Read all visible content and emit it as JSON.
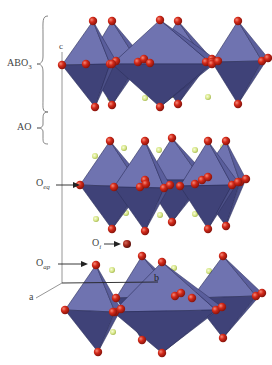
{
  "figure": {
    "labels": {
      "abo3": {
        "main": "ABO",
        "sub": "3"
      },
      "ao": {
        "main": "AO"
      },
      "o_eq": {
        "main": "O",
        "sub": "eq"
      },
      "o_ap": {
        "main": "O",
        "sub": "ap"
      },
      "o_i": {
        "main": "O",
        "sub": "i"
      },
      "axis_a": "a",
      "axis_b": "b",
      "axis_c": "c"
    },
    "colors": {
      "octahedron_light": "#6f73b0",
      "octahedron_mid": "#5a5e9c",
      "octahedron_dark": "#3f4278",
      "octahedron_edge": "#2c2f5a",
      "oxygen": "#d42a1a",
      "oxygen_highlight": "#f26a55",
      "interstitial_oxygen": "#a8281c",
      "a_cation": "#d8e88a",
      "axis_line": "#8a8a8a",
      "label_text": "#444444"
    },
    "layers": [
      {
        "name": "top-octahedra-layer",
        "top": 21,
        "eq": 65,
        "bottom": 107,
        "back": [
          [
            112,
            21,
            86,
            64,
            138,
            62,
            112,
            105
          ],
          [
            178,
            21,
            150,
            63,
            206,
            62,
            178,
            104
          ],
          [
            238,
            21,
            212,
            62,
            262,
            61,
            238,
            104
          ]
        ],
        "front": [
          [
            93,
            21,
            62,
            65,
            110,
            64,
            95,
            107
          ],
          [
            160,
            20,
            112,
            64,
            212,
            64,
            160,
            107
          ]
        ],
        "a_cations": [
          [
            110,
            98
          ],
          [
            145,
            98
          ],
          [
            172,
            95
          ],
          [
            208,
            97
          ]
        ]
      },
      {
        "name": "middle-octahedra-layer",
        "top": 141,
        "eq": 185,
        "bottom": 229,
        "back": [
          [
            172,
            138,
            145,
            180,
            202,
            180,
            172,
            222
          ],
          [
            226,
            141,
            195,
            184,
            240,
            182,
            226,
            226
          ]
        ],
        "front": [
          [
            110,
            141,
            80,
            185,
            140,
            187,
            112,
            229
          ],
          [
            145,
            141,
            114,
            187,
            164,
            188,
            145,
            231
          ],
          [
            208,
            141,
            180,
            186,
            232,
            185,
            208,
            229
          ]
        ],
        "a_cations": [
          [
            95,
            156
          ],
          [
            124,
            148
          ],
          [
            159,
            150
          ],
          [
            195,
            150
          ],
          [
            223,
            147
          ],
          [
            96,
            219
          ],
          [
            126,
            213
          ],
          [
            160,
            215
          ],
          [
            195,
            214
          ],
          [
            222,
            212
          ]
        ]
      },
      {
        "name": "bottom-octahedra-layer",
        "top": 258,
        "eq": 305,
        "bottom": 350,
        "back": [
          [
            142,
            256,
            116,
            298,
            175,
            296,
            142,
            340
          ],
          [
            223,
            256,
            192,
            298,
            256,
            296,
            223,
            338
          ]
        ],
        "front": [
          [
            96,
            265,
            65,
            310,
            115,
            312,
            98,
            352
          ],
          [
            162,
            262,
            113,
            312,
            216,
            310,
            162,
            353
          ]
        ],
        "a_cations": [
          [
            112,
            270
          ],
          [
            147,
            273
          ],
          [
            174,
            268
          ],
          [
            209,
            271
          ],
          [
            113,
            332
          ]
        ]
      }
    ],
    "interstitial_oxygen_pos": [
      127,
      244
    ],
    "axes": {
      "origin": [
        62,
        283
      ],
      "c_end": [
        62,
        52
      ],
      "a_end": [
        36,
        298
      ],
      "b_end": [
        158,
        282
      ]
    }
  }
}
